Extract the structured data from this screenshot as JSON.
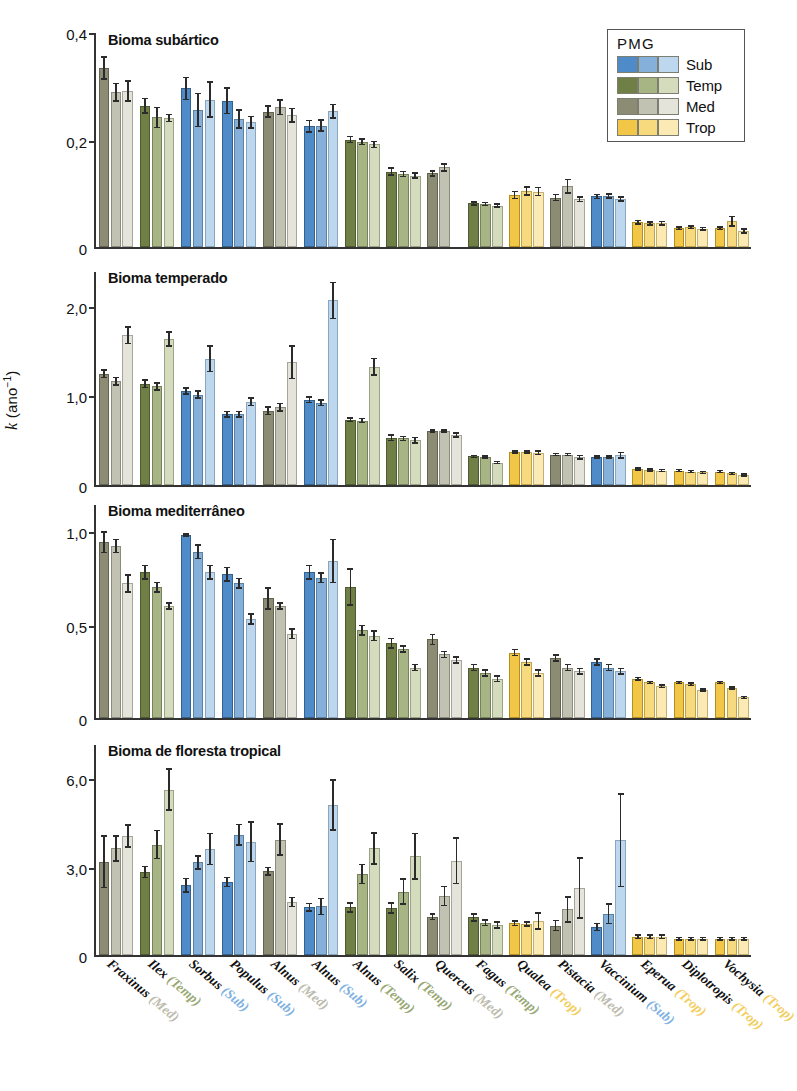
{
  "axis": {
    "ylabel_k": "k",
    "ylabel_unit": " (ano",
    "ylabel_exp": "−1",
    "ylabel_close": ")"
  },
  "legend": {
    "title": "PMG",
    "entries": [
      {
        "key": "sub",
        "label": "Sub",
        "colors": [
          "#4e8bc8",
          "#84b0da",
          "#bcd7ee"
        ]
      },
      {
        "key": "temp",
        "label": "Temp",
        "colors": [
          "#6f7f45",
          "#a7b585",
          "#d5dcbe"
        ]
      },
      {
        "key": "med",
        "label": "Med",
        "colors": [
          "#8c8c75",
          "#c2c2b2",
          "#e4e4da"
        ]
      },
      {
        "key": "trop",
        "label": "Trop",
        "colors": [
          "#f2c748",
          "#f7da7d",
          "#fbeab4"
        ]
      }
    ]
  },
  "categories": [
    {
      "genus": "Fraxinus",
      "pmg": "Med"
    },
    {
      "genus": "Ilex",
      "pmg": "Temp"
    },
    {
      "genus": "Sorbus",
      "pmg": "Sub"
    },
    {
      "genus": "Populus",
      "pmg": "Sub"
    },
    {
      "genus": "Alnus",
      "pmg": "Med"
    },
    {
      "genus": "Alnus",
      "pmg": "Sub"
    },
    {
      "genus": "Alnus",
      "pmg": "Temp"
    },
    {
      "genus": "Salix",
      "pmg": "Temp"
    },
    {
      "genus": "Quercus",
      "pmg": "Med"
    },
    {
      "genus": "Fagus",
      "pmg": "Temp"
    },
    {
      "genus": "Qualea",
      "pmg": "Trop"
    },
    {
      "genus": "Pistacia",
      "pmg": "Med"
    },
    {
      "genus": "Vaccinium",
      "pmg": "Sub"
    },
    {
      "genus": "Eperua",
      "pmg": "Trop"
    },
    {
      "genus": "Diplotropis",
      "pmg": "Trop"
    },
    {
      "genus": "Vochysia",
      "pmg": "Trop"
    }
  ],
  "chart_data": {
    "type": "bar",
    "title": "",
    "xlabel": "",
    "ylabel": "k (ano−1)",
    "grid": false,
    "legend_position": "top-right",
    "series_note": "Within each species group the three bars are the dark/medium/light shades of that species' PMG colour.",
    "categories": [
      "Fraxinus (Med)",
      "Ilex (Temp)",
      "Sorbus (Sub)",
      "Populus (Sub)",
      "Alnus (Med)",
      "Alnus (Sub)",
      "Alnus (Temp)",
      "Salix (Temp)",
      "Quercus (Med)",
      "Fagus (Temp)",
      "Qualea (Trop)",
      "Pistacia (Med)",
      "Vaccinium (Sub)",
      "Eperua (Trop)",
      "Diplotropis (Trop)",
      "Vochysia (Trop)"
    ],
    "panels": [
      {
        "title": "Bioma subártico",
        "pmg": "med",
        "ylim": [
          0,
          0.4
        ],
        "yticks": [
          0,
          0.2,
          0.4
        ],
        "yticklabels": [
          "0",
          "0,2",
          "0,4"
        ],
        "values": [
          [
            0.333,
            0.288,
            0.29
          ],
          [
            0.263,
            0.241,
            0.24
          ],
          [
            0.295,
            0.255,
            0.274
          ],
          [
            0.272,
            0.238,
            0.232
          ],
          [
            0.252,
            0.26,
            0.245
          ],
          [
            0.225,
            0.226,
            0.253
          ],
          [
            0.2,
            0.196,
            0.191
          ],
          [
            0.14,
            0.136,
            0.133
          ],
          [
            0.137,
            0.148,
            0.0
          ],
          [
            0.081,
            0.08,
            0.077
          ],
          [
            0.097,
            0.104,
            0.103
          ],
          [
            0.092,
            0.113,
            0.089
          ],
          [
            0.094,
            0.095,
            0.089
          ],
          [
            0.046,
            0.044,
            0.044
          ],
          [
            0.035,
            0.037,
            0.034
          ],
          [
            0.035,
            0.048,
            0.03
          ]
        ],
        "errors": [
          [
            0.022,
            0.018,
            0.02
          ],
          [
            0.015,
            0.02,
            0.008
          ],
          [
            0.022,
            0.032,
            0.034
          ],
          [
            0.025,
            0.018,
            0.012
          ],
          [
            0.012,
            0.015,
            0.014
          ],
          [
            0.012,
            0.012,
            0.014
          ],
          [
            0.007,
            0.007,
            0.007
          ],
          [
            0.008,
            0.006,
            0.006
          ],
          [
            0.006,
            0.008,
            0.0
          ],
          [
            0.004,
            0.004,
            0.004
          ],
          [
            0.008,
            0.009,
            0.009
          ],
          [
            0.007,
            0.014,
            0.006
          ],
          [
            0.005,
            0.005,
            0.005
          ],
          [
            0.005,
            0.004,
            0.005
          ],
          [
            0.004,
            0.004,
            0.004
          ],
          [
            0.004,
            0.01,
            0.005
          ]
        ]
      },
      {
        "title": "Bioma temperado",
        "pmg": "med",
        "ylim": [
          0,
          2.4
        ],
        "yticks": [
          0,
          1.0,
          2.0
        ],
        "yticklabels": [
          "0",
          "1,0",
          "2,0"
        ],
        "values": [
          [
            1.24,
            1.16,
            1.67
          ],
          [
            1.13,
            1.1,
            1.63
          ],
          [
            1.05,
            1.01,
            1.41
          ],
          [
            0.79,
            0.79,
            0.93
          ],
          [
            0.83,
            0.87,
            1.37
          ],
          [
            0.95,
            0.92,
            2.06
          ],
          [
            0.73,
            0.72,
            1.32
          ],
          [
            0.53,
            0.52,
            0.5
          ],
          [
            0.6,
            0.6,
            0.56
          ],
          [
            0.32,
            0.31,
            0.25
          ],
          [
            0.37,
            0.37,
            0.36
          ],
          [
            0.34,
            0.34,
            0.31
          ],
          [
            0.31,
            0.31,
            0.33
          ],
          [
            0.18,
            0.17,
            0.16
          ],
          [
            0.16,
            0.15,
            0.14
          ],
          [
            0.15,
            0.13,
            0.11
          ]
        ],
        "errors": [
          [
            0.05,
            0.05,
            0.1
          ],
          [
            0.05,
            0.05,
            0.09
          ],
          [
            0.04,
            0.05,
            0.15
          ],
          [
            0.04,
            0.04,
            0.05
          ],
          [
            0.05,
            0.05,
            0.19
          ],
          [
            0.04,
            0.04,
            0.21
          ],
          [
            0.03,
            0.03,
            0.1
          ],
          [
            0.04,
            0.03,
            0.04
          ],
          [
            0.02,
            0.02,
            0.03
          ],
          [
            0.02,
            0.02,
            0.02
          ],
          [
            0.02,
            0.02,
            0.03
          ],
          [
            0.02,
            0.02,
            0.03
          ],
          [
            0.02,
            0.02,
            0.04
          ],
          [
            0.02,
            0.02,
            0.02
          ],
          [
            0.02,
            0.02,
            0.02
          ],
          [
            0.02,
            0.02,
            0.02
          ]
        ]
      },
      {
        "title": "Bioma mediterrâneo",
        "pmg": "med",
        "ylim": [
          0,
          1.15
        ],
        "yticks": [
          0,
          0.5,
          1.0
        ],
        "yticklabels": [
          "0",
          "0,5",
          "1,0"
        ],
        "values": [
          [
            0.94,
            0.92,
            0.72
          ],
          [
            0.78,
            0.7,
            0.6
          ],
          [
            0.98,
            0.89,
            0.78
          ],
          [
            0.77,
            0.72,
            0.53
          ],
          [
            0.64,
            0.6,
            0.45
          ],
          [
            0.78,
            0.75,
            0.84
          ],
          [
            0.7,
            0.47,
            0.44
          ],
          [
            0.4,
            0.37,
            0.27
          ],
          [
            0.42,
            0.34,
            0.31
          ],
          [
            0.27,
            0.24,
            0.21
          ],
          [
            0.35,
            0.3,
            0.24
          ],
          [
            0.32,
            0.27,
            0.25
          ],
          [
            0.3,
            0.27,
            0.25
          ],
          [
            0.21,
            0.19,
            0.17
          ],
          [
            0.19,
            0.18,
            0.15
          ],
          [
            0.19,
            0.16,
            0.11
          ]
        ],
        "errors": [
          [
            0.06,
            0.04,
            0.05
          ],
          [
            0.04,
            0.03,
            0.02
          ],
          [
            0.01,
            0.04,
            0.04
          ],
          [
            0.04,
            0.03,
            0.03
          ],
          [
            0.06,
            0.02,
            0.03
          ],
          [
            0.04,
            0.03,
            0.12
          ],
          [
            0.1,
            0.03,
            0.03
          ],
          [
            0.03,
            0.02,
            0.02
          ],
          [
            0.03,
            0.02,
            0.02
          ],
          [
            0.02,
            0.02,
            0.02
          ],
          [
            0.02,
            0.02,
            0.02
          ],
          [
            0.02,
            0.02,
            0.02
          ],
          [
            0.02,
            0.02,
            0.02
          ],
          [
            0.01,
            0.01,
            0.01
          ],
          [
            0.01,
            0.01,
            0.01
          ],
          [
            0.01,
            0.01,
            0.01
          ]
        ]
      },
      {
        "title": "Bioma de floresta tropical",
        "pmg": "med",
        "ylim": [
          0,
          7.2
        ],
        "yticks": [
          0,
          3.0,
          6.0
        ],
        "yticklabels": [
          "0",
          "3,0",
          "6,0"
        ],
        "values": [
          [
            3.17,
            3.62,
            4.05
          ],
          [
            2.82,
            3.75,
            5.62
          ],
          [
            2.37,
            3.15,
            3.6
          ],
          [
            2.48,
            4.08,
            3.85
          ],
          [
            2.85,
            3.92,
            1.8
          ],
          [
            1.62,
            1.65,
            5.1
          ],
          [
            1.62,
            2.75,
            3.62
          ],
          [
            1.6,
            2.15,
            3.35
          ],
          [
            1.3,
            2.0,
            3.2
          ],
          [
            1.28,
            1.1,
            1.02
          ],
          [
            1.08,
            1.05,
            1.15
          ],
          [
            1.0,
            1.55,
            2.28
          ],
          [
            0.95,
            1.4,
            3.9
          ],
          [
            0.62,
            0.62,
            0.62
          ],
          [
            0.55,
            0.55,
            0.55
          ],
          [
            0.55,
            0.55,
            0.55
          ]
        ],
        "errors": [
          [
            0.9,
            0.45,
            0.4
          ],
          [
            0.22,
            0.5,
            0.72
          ],
          [
            0.25,
            0.25,
            0.55
          ],
          [
            0.18,
            0.38,
            0.7
          ],
          [
            0.15,
            0.55,
            0.18
          ],
          [
            0.15,
            0.3,
            0.88
          ],
          [
            0.18,
            0.35,
            0.55
          ],
          [
            0.2,
            0.45,
            0.8
          ],
          [
            0.12,
            0.35,
            0.8
          ],
          [
            0.15,
            0.12,
            0.12
          ],
          [
            0.1,
            0.1,
            0.3
          ],
          [
            0.2,
            0.45,
            1.05
          ],
          [
            0.15,
            0.35,
            1.6
          ],
          [
            0.08,
            0.08,
            0.08
          ],
          [
            0.07,
            0.07,
            0.07
          ],
          [
            0.07,
            0.07,
            0.07
          ]
        ]
      }
    ]
  }
}
